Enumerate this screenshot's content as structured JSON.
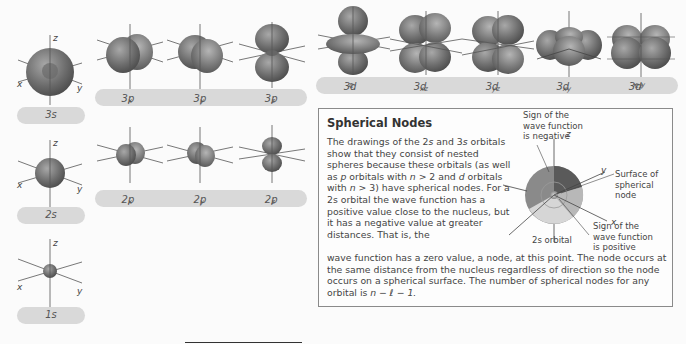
{
  "orbitals": {
    "s": [
      {
        "label": "3s",
        "n": "3",
        "sub": "s"
      },
      {
        "label": "2s",
        "n": "2",
        "sub": "s"
      },
      {
        "label": "1s",
        "n": "1",
        "sub": "s"
      }
    ],
    "p3": [
      {
        "label": "3px",
        "n": "3p",
        "sub": "x"
      },
      {
        "label": "3py",
        "n": "3p",
        "sub": "y"
      },
      {
        "label": "3pz",
        "n": "3p",
        "sub": "z"
      }
    ],
    "p2": [
      {
        "label": "2px",
        "n": "2p",
        "sub": "x"
      },
      {
        "label": "2py",
        "n": "2p",
        "sub": "y"
      },
      {
        "label": "2pz",
        "n": "2p",
        "sub": "z"
      }
    ],
    "d3": [
      {
        "label": "3dz2",
        "n": "3d",
        "sub": "z",
        "sup": "2"
      },
      {
        "label": "3dxz",
        "n": "3d",
        "sub": "xz"
      },
      {
        "label": "3dyz",
        "n": "3d",
        "sub": "yz"
      },
      {
        "label": "3dxy",
        "n": "3d",
        "sub": "xy"
      },
      {
        "label": "3dx2-y2",
        "n": "3d",
        "sub": "x",
        "sup": "2",
        "tail_sub": "− y",
        "tail_sup": "2"
      }
    ]
  },
  "axes": {
    "x": "x",
    "y": "y",
    "z": "z"
  },
  "box": {
    "title": "Spherical Nodes",
    "para1_a": "The drawings of the 2",
    "para1_s1": "s",
    "para1_b": " and 3",
    "para1_s2": "s",
    "para1_c": " orbitals show that they consist of nested spheres because these orbitals (as well as ",
    "para1_p": "p",
    "para1_d": " orbitals with ",
    "para1_n1": "n",
    "para1_e": " > 2 and ",
    "para1_dd": "d",
    "para1_f": " orbitals with ",
    "para1_n2": "n",
    "para1_g": " > 3) have spherical nodes. For a 2s orbital the wave function has a positive value close to the nucleus, but it has a negative value at greater distances. That is, the",
    "para2_a": "wave function has a zero value, a node, at this point. The node occurs at the same distance from the nucleus regardless of direction so the node occurs on a spherical surface. The number of spherical nodes for any orbital is ",
    "para2_formula": "n − ℓ − 1.",
    "annotations": {
      "negative": "Sign of the wave function is negative",
      "surface": "Surface of spherical node",
      "positive": "Sign of the wave function is positive",
      "caption": "2s orbital",
      "z": "z",
      "y": "y",
      "x": "x"
    }
  },
  "colors": {
    "pill": "#d9d9d9",
    "lobe_dark": "#5e5e5e",
    "lobe_light": "#9a9a9a",
    "axis": "#555555",
    "border": "#8a8a8a"
  }
}
